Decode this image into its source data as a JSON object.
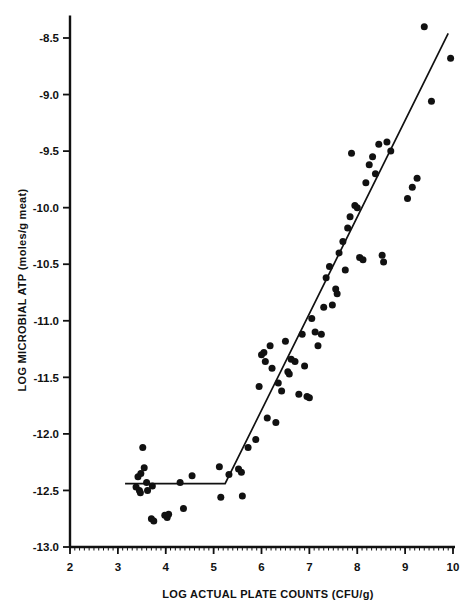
{
  "chart_data": {
    "type": "scatter",
    "title": "",
    "xlabel": "LOG ACTUAL PLATE COUNTS (CFU/g)",
    "ylabel": "LOG MICROBIAL ATP (moles/g meat)",
    "xlim": [
      2,
      10
    ],
    "ylim": [
      -13.0,
      -8.3
    ],
    "xticks": [
      2,
      3,
      4,
      5,
      6,
      7,
      8,
      9,
      10
    ],
    "xtick_labels": [
      "2",
      "3",
      "4",
      "5",
      "6",
      "7",
      "8",
      "9",
      "10"
    ],
    "yticks": [
      -8.5,
      -9.0,
      -9.5,
      -10.0,
      -10.5,
      -11.0,
      -11.5,
      -12.0,
      -12.5,
      -13.0
    ],
    "ytick_labels": [
      "-8.5",
      "-9.0",
      "-9.5",
      "-10.0",
      "-10.5",
      "-11.0",
      "-11.5",
      "-12.0",
      "-12.5",
      "-13.0"
    ],
    "minor_tick_interval": 0.1,
    "grid": false,
    "legend": null,
    "marker": {
      "shape": "circle",
      "color": "#111111",
      "size_px": 7
    },
    "series": [
      {
        "name": "samples",
        "points": [
          [
            3.42,
            -12.38
          ],
          [
            3.48,
            -12.35
          ],
          [
            3.52,
            -12.12
          ],
          [
            3.55,
            -12.3
          ],
          [
            3.38,
            -12.47
          ],
          [
            3.45,
            -12.5
          ],
          [
            3.47,
            -12.52
          ],
          [
            3.6,
            -12.43
          ],
          [
            3.62,
            -12.5
          ],
          [
            3.7,
            -12.75
          ],
          [
            3.72,
            -12.46
          ],
          [
            3.75,
            -12.77
          ],
          [
            3.98,
            -12.72
          ],
          [
            4.03,
            -12.74
          ],
          [
            4.06,
            -12.71
          ],
          [
            4.3,
            -12.43
          ],
          [
            4.37,
            -12.66
          ],
          [
            4.55,
            -12.37
          ],
          [
            5.12,
            -12.29
          ],
          [
            5.15,
            -12.56
          ],
          [
            5.32,
            -12.36
          ],
          [
            5.52,
            -12.31
          ],
          [
            5.58,
            -12.34
          ],
          [
            5.6,
            -12.55
          ],
          [
            5.72,
            -12.12
          ],
          [
            5.88,
            -12.05
          ],
          [
            5.95,
            -11.58
          ],
          [
            6.0,
            -11.3
          ],
          [
            6.05,
            -11.28
          ],
          [
            6.08,
            -11.36
          ],
          [
            6.12,
            -11.86
          ],
          [
            6.18,
            -11.22
          ],
          [
            6.22,
            -11.42
          ],
          [
            6.3,
            -11.9
          ],
          [
            6.35,
            -11.55
          ],
          [
            6.42,
            -11.62
          ],
          [
            6.5,
            -11.18
          ],
          [
            6.55,
            -11.45
          ],
          [
            6.58,
            -11.47
          ],
          [
            6.62,
            -11.34
          ],
          [
            6.7,
            -11.36
          ],
          [
            6.78,
            -11.65
          ],
          [
            6.85,
            -11.12
          ],
          [
            6.9,
            -11.4
          ],
          [
            6.95,
            -11.67
          ],
          [
            7.0,
            -11.68
          ],
          [
            7.05,
            -10.98
          ],
          [
            7.12,
            -11.1
          ],
          [
            7.18,
            -11.22
          ],
          [
            7.25,
            -11.12
          ],
          [
            7.3,
            -10.88
          ],
          [
            7.35,
            -10.62
          ],
          [
            7.42,
            -10.52
          ],
          [
            7.48,
            -10.86
          ],
          [
            7.55,
            -10.72
          ],
          [
            7.58,
            -10.76
          ],
          [
            7.62,
            -10.4
          ],
          [
            7.7,
            -10.3
          ],
          [
            7.75,
            -10.55
          ],
          [
            7.8,
            -10.18
          ],
          [
            7.85,
            -10.08
          ],
          [
            7.88,
            -9.52
          ],
          [
            7.95,
            -9.98
          ],
          [
            8.0,
            -10.0
          ],
          [
            8.05,
            -10.44
          ],
          [
            8.12,
            -10.46
          ],
          [
            8.18,
            -9.78
          ],
          [
            8.25,
            -9.62
          ],
          [
            8.32,
            -9.55
          ],
          [
            8.38,
            -9.7
          ],
          [
            8.45,
            -9.44
          ],
          [
            8.52,
            -10.42
          ],
          [
            8.55,
            -10.48
          ],
          [
            8.62,
            -9.42
          ],
          [
            8.7,
            -9.5
          ],
          [
            9.05,
            -9.92
          ],
          [
            9.15,
            -9.82
          ],
          [
            9.25,
            -9.74
          ],
          [
            9.4,
            -8.4
          ],
          [
            9.55,
            -9.06
          ],
          [
            9.95,
            -8.68
          ]
        ]
      }
    ],
    "fit_line": {
      "type": "segmented-linear",
      "description": "horizontal plateau then rising linear segment",
      "vertices": [
        [
          3.15,
          -12.44
        ],
        [
          5.24,
          -12.44
        ],
        [
          9.9,
          -8.46
        ]
      ]
    }
  },
  "figure": {
    "background": "#ffffff",
    "line_color": "#111111",
    "axis_color": "#111111"
  }
}
